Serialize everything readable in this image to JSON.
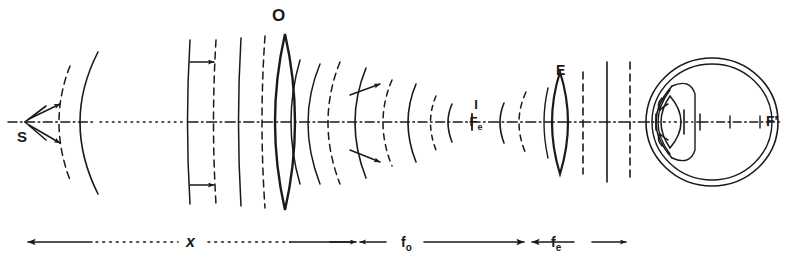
{
  "figure": {
    "type": "optical-ray-wavefront-diagram",
    "title_label": "",
    "background_color": "#ffffff",
    "ink_color": "#1a1a1a"
  },
  "labels": {
    "source": "S",
    "objective": "O",
    "eyepiece": "E",
    "image_numerator": "I",
    "image_denominator": "F",
    "image_denominator_sub": "e",
    "far_point": "F'"
  },
  "scale_bar": {
    "segments": [
      {
        "id": "x",
        "label": "x",
        "sub": "",
        "arrows": "left"
      },
      {
        "id": "fo",
        "label": "f",
        "sub": "o",
        "arrows": "both"
      },
      {
        "id": "fe",
        "label": "f",
        "sub": "e",
        "arrows": "both"
      }
    ]
  },
  "elements": [
    {
      "name": "point-source",
      "symbol": "S",
      "x": 28,
      "y": 122
    },
    {
      "name": "diverging-wavefront-solid",
      "x": 86,
      "y": 122
    },
    {
      "name": "diverging-wavefront-dashed",
      "x": 66,
      "y": 122
    },
    {
      "name": "plane-wavefront-1-solid",
      "x": 192,
      "y": 122
    },
    {
      "name": "plane-wavefront-1-dashed",
      "x": 215,
      "y": 122
    },
    {
      "name": "plane-wavefront-2-solid",
      "x": 240,
      "y": 122
    },
    {
      "name": "plane-wavefront-2-dashed",
      "x": 263,
      "y": 122
    },
    {
      "name": "objective-lens",
      "symbol": "O",
      "x": 285,
      "y": 122
    },
    {
      "name": "converging-wavefront-dashed-1",
      "x": 330,
      "y": 122
    },
    {
      "name": "converging-wavefront-solid-1",
      "x": 363,
      "y": 122
    },
    {
      "name": "converging-wavefront-dashed-2",
      "x": 390,
      "y": 122
    },
    {
      "name": "converging-wavefront-solid-2",
      "x": 415,
      "y": 122
    },
    {
      "name": "converging-wavefront-dashed-3",
      "x": 432,
      "y": 122
    },
    {
      "name": "intermediate-image",
      "symbol": "I/Fe",
      "x": 472,
      "y": 122
    },
    {
      "name": "diverging-wavefront-solid-after-image",
      "x": 500,
      "y": 122
    },
    {
      "name": "diverging-wavefront-dashed-after-image",
      "x": 520,
      "y": 122
    },
    {
      "name": "eyepiece-lens",
      "symbol": "E",
      "x": 560,
      "y": 122
    },
    {
      "name": "exit-plane-wavefront-dashed-1",
      "x": 583,
      "y": 122
    },
    {
      "name": "exit-plane-wavefront-solid",
      "x": 605,
      "y": 122
    },
    {
      "name": "exit-plane-wavefront-dashed-2",
      "x": 627,
      "y": 122
    },
    {
      "name": "eye",
      "symbol": "",
      "x": 705,
      "y": 122
    },
    {
      "name": "far-point-focus",
      "symbol": "F'",
      "x": 762,
      "y": 122
    }
  ],
  "axis": {
    "name": "optical-axis",
    "style": "dash-dot-with-dotted-break",
    "y": 122,
    "x_start": 8,
    "x_end": 790
  }
}
